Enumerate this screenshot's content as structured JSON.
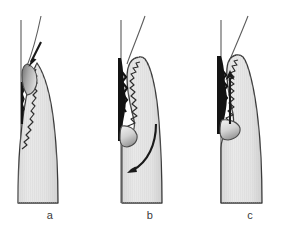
{
  "figure": {
    "panel_count": 3,
    "background_color": "#ffffff",
    "width": 300,
    "height": 238
  },
  "colors": {
    "tissue_fill": "#e6e6e6",
    "tissue_fill_dark": "#cfcfcf",
    "outline": "#3a3a3a",
    "outline_soft": "#8a8a8a",
    "defect_black": "#111111",
    "instrument_gray": "#9b9b9b",
    "instrument_light": "#d8d8d8",
    "label_text": "#3a3a3a",
    "root_line": "#6e6e6e"
  },
  "panels": [
    {
      "id": "a",
      "label": "a",
      "description": "Papilla with blunted tip; probe inserted obliquely from coronal aspect, arrow directed apically into the sulcus.",
      "arrow": {
        "name": "insertion-arrow",
        "direction": "down-right",
        "style": "straight",
        "meaning": "instrument insertion"
      },
      "features": [
        "root-surface-line",
        "instrument-shaft",
        "papilla-body",
        "gingival-crevicular-defect",
        "serrated-epithelial-border",
        "stippled-connective-tissue"
      ]
    },
    {
      "id": "b",
      "label": "b",
      "description": "Papilla elevated and displaced; curved arrow indicates rotation / coronal repositioning of the tissue flap.",
      "arrow": {
        "name": "rotation-arrow",
        "direction": "curved-counterclockwise",
        "style": "curved",
        "meaning": "tissue rotation"
      },
      "features": [
        "root-surface-line",
        "instrument-shaft",
        "papilla-body-displaced",
        "deep-black-defect",
        "serrated-epithelial-border",
        "stippled-connective-tissue"
      ]
    },
    {
      "id": "c",
      "label": "c",
      "description": "Papilla repositioned coronally; straight arrow directed upward showing coronal advancement against the root surface.",
      "arrow": {
        "name": "coronal-advance-arrow",
        "direction": "up",
        "style": "straight",
        "meaning": "coronal advancement"
      },
      "features": [
        "root-surface-line",
        "instrument-shaft",
        "papilla-body-advanced",
        "deep-black-defect",
        "serrated-epithelial-border",
        "stippled-connective-tissue"
      ]
    }
  ]
}
